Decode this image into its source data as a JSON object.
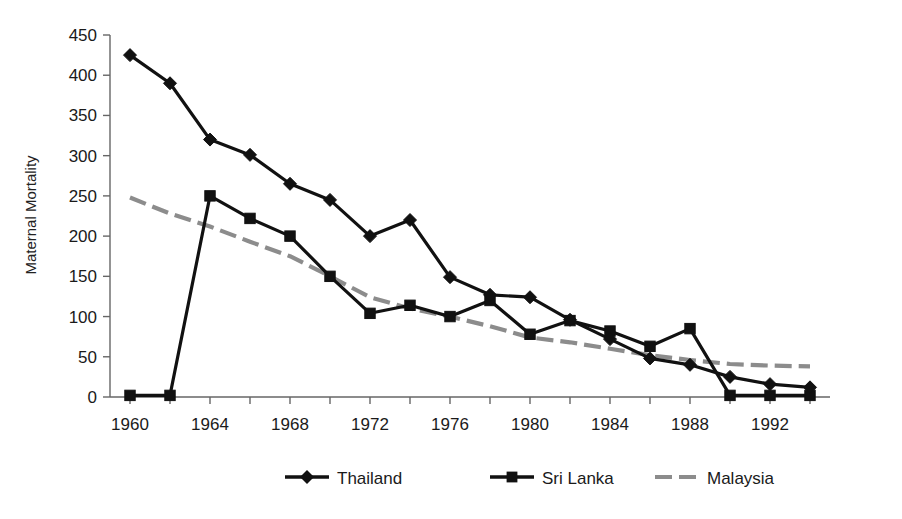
{
  "chart_data": {
    "type": "line",
    "title": "",
    "xlabel": "",
    "ylabel": "Maternal Mortality",
    "x": [
      1960,
      1962,
      1964,
      1966,
      1968,
      1970,
      1972,
      1974,
      1976,
      1978,
      1980,
      1982,
      1984,
      1986,
      1988,
      1990,
      1992,
      1994
    ],
    "xlim": [
      1959,
      1995
    ],
    "ylim": [
      0,
      450
    ],
    "ytick_labels": [
      "0",
      "50",
      "100",
      "150",
      "200",
      "250",
      "300",
      "350",
      "400",
      "450"
    ],
    "yticks": [
      0,
      50,
      100,
      150,
      200,
      250,
      300,
      350,
      400,
      450
    ],
    "xtick_labels": [
      "1960",
      "1964",
      "1968",
      "1972",
      "1976",
      "1980",
      "1984",
      "1988",
      "1992"
    ],
    "xticks_labeled": [
      1960,
      1964,
      1968,
      1972,
      1976,
      1980,
      1984,
      1988,
      1992
    ],
    "xticks_minor": [
      1962,
      1966,
      1970,
      1974,
      1978,
      1982,
      1986,
      1990,
      1994
    ],
    "grid": false,
    "legend_position": "bottom",
    "series": [
      {
        "name": "Thailand",
        "marker": "diamond",
        "color": "#111111",
        "dash": "solid",
        "values": [
          425,
          390,
          320,
          301,
          265,
          245,
          200,
          220,
          149,
          127,
          124,
          96,
          72,
          48,
          40,
          25,
          16,
          12
        ]
      },
      {
        "name": "Sri Lanka",
        "marker": "square",
        "color": "#111111",
        "dash": "solid",
        "values": [
          2,
          2,
          250,
          222,
          200,
          150,
          104,
          114,
          100,
          120,
          78,
          95,
          82,
          63,
          85,
          2,
          2,
          2
        ]
      },
      {
        "name": "Malaysia",
        "marker": "none",
        "color": "#8c8c8c",
        "dash": "dashed",
        "values": [
          248,
          228,
          212,
          193,
          175,
          150,
          124,
          110,
          100,
          88,
          74,
          68,
          60,
          52,
          46,
          41,
          39,
          38
        ]
      }
    ]
  },
  "legend": {
    "items": [
      {
        "label": "Thailand"
      },
      {
        "label": "Sri Lanka"
      },
      {
        "label": "Malaysia"
      }
    ]
  },
  "axes": {
    "y_title": "Maternal Mortality"
  }
}
